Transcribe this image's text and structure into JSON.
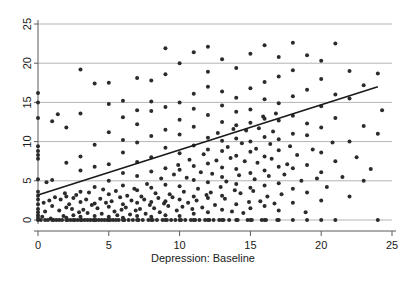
{
  "chart_data": {
    "type": "scatter",
    "title": "",
    "subtitle": "",
    "xlabel": "Depression: Baseline",
    "ylabel": "",
    "xlim": [
      0,
      25
    ],
    "ylim": [
      0,
      25
    ],
    "xticks": [
      0,
      5,
      10,
      15,
      20,
      25
    ],
    "yticks": [
      0,
      5,
      10,
      15,
      20,
      25
    ],
    "xtick_labels": [
      "0",
      "5",
      "10",
      "15",
      "20",
      "25"
    ],
    "ytick_labels": [
      "0",
      "5",
      "10",
      "15",
      "20",
      "25"
    ],
    "grid": "horizontal",
    "grid_color": "#b4b4b4",
    "legend": "none",
    "point_color": "#2b2b2b",
    "point_size": 4,
    "line_color": "#1a1a1a",
    "axis_color": "#5a5a5a",
    "fit_line": {
      "name": "linear fit",
      "x": [
        0,
        24
      ],
      "y": [
        3.2,
        17.0
      ],
      "slope": 0.575,
      "intercept": 3.2
    },
    "points": [
      [
        0.0,
        0.0
      ],
      [
        0.0,
        0.3
      ],
      [
        0.0,
        0.6
      ],
      [
        0.0,
        1.0
      ],
      [
        0.0,
        1.4
      ],
      [
        0.0,
        2.0
      ],
      [
        0.0,
        2.6
      ],
      [
        0.0,
        3.1
      ],
      [
        0.0,
        3.6
      ],
      [
        0.0,
        5.2
      ],
      [
        0.0,
        7.8
      ],
      [
        0.0,
        8.3
      ],
      [
        0.0,
        8.8
      ],
      [
        0.0,
        9.4
      ],
      [
        0.0,
        13.0
      ],
      [
        0.0,
        15.0
      ],
      [
        0.0,
        16.2
      ],
      [
        0.2,
        0.0
      ],
      [
        0.3,
        0.4
      ],
      [
        0.4,
        2.2
      ],
      [
        0.5,
        0.0
      ],
      [
        0.5,
        1.1
      ],
      [
        0.6,
        4.8
      ],
      [
        0.7,
        0.0
      ],
      [
        0.8,
        2.5
      ],
      [
        0.9,
        0.2
      ],
      [
        1.0,
        0.0
      ],
      [
        1.0,
        1.8
      ],
      [
        1.0,
        5.1
      ],
      [
        1.0,
        12.6
      ],
      [
        1.1,
        0.0
      ],
      [
        1.2,
        2.9
      ],
      [
        1.3,
        0.0
      ],
      [
        1.4,
        13.5
      ],
      [
        1.5,
        0.0
      ],
      [
        1.5,
        1.2
      ],
      [
        1.6,
        2.6
      ],
      [
        1.7,
        0.0
      ],
      [
        1.8,
        0.5
      ],
      [
        1.9,
        3.4
      ],
      [
        2.0,
        0.0
      ],
      [
        2.0,
        0.3
      ],
      [
        2.0,
        1.6
      ],
      [
        2.0,
        3.0
      ],
      [
        2.0,
        7.3
      ],
      [
        2.0,
        11.8
      ],
      [
        2.1,
        0.0
      ],
      [
        2.2,
        2.0
      ],
      [
        2.3,
        0.0
      ],
      [
        2.4,
        1.4
      ],
      [
        2.5,
        0.0
      ],
      [
        2.5,
        0.6
      ],
      [
        2.5,
        2.8
      ],
      [
        2.6,
        0.0
      ],
      [
        2.7,
        3.2
      ],
      [
        2.8,
        0.0
      ],
      [
        2.9,
        1.0
      ],
      [
        3.0,
        0.0
      ],
      [
        3.0,
        0.4
      ],
      [
        3.0,
        2.3
      ],
      [
        3.0,
        3.6
      ],
      [
        3.0,
        6.3
      ],
      [
        3.0,
        8.1
      ],
      [
        3.0,
        13.6
      ],
      [
        3.0,
        19.2
      ],
      [
        3.1,
        0.0
      ],
      [
        3.2,
        1.3
      ],
      [
        3.3,
        0.0
      ],
      [
        3.4,
        2.6
      ],
      [
        3.5,
        0.0
      ],
      [
        3.5,
        0.9
      ],
      [
        3.6,
        3.5
      ],
      [
        3.7,
        0.0
      ],
      [
        3.8,
        1.9
      ],
      [
        3.9,
        0.0
      ],
      [
        4.0,
        0.0
      ],
      [
        4.0,
        0.5
      ],
      [
        4.0,
        2.1
      ],
      [
        4.0,
        4.2
      ],
      [
        4.0,
        6.8
      ],
      [
        4.0,
        9.6
      ],
      [
        4.0,
        17.4
      ],
      [
        4.1,
        0.0
      ],
      [
        4.2,
        1.5
      ],
      [
        4.3,
        0.0
      ],
      [
        4.4,
        2.7
      ],
      [
        4.5,
        0.0
      ],
      [
        4.5,
        0.8
      ],
      [
        4.6,
        3.9
      ],
      [
        4.7,
        0.0
      ],
      [
        4.8,
        2.2
      ],
      [
        4.9,
        0.0
      ],
      [
        5.0,
        0.0
      ],
      [
        5.0,
        0.4
      ],
      [
        5.0,
        1.7
      ],
      [
        5.0,
        3.3
      ],
      [
        5.0,
        5.0
      ],
      [
        5.0,
        7.1
      ],
      [
        5.0,
        11.2
      ],
      [
        5.0,
        14.8
      ],
      [
        5.0,
        17.5
      ],
      [
        5.1,
        0.0
      ],
      [
        5.2,
        2.4
      ],
      [
        5.3,
        0.0
      ],
      [
        5.4,
        1.1
      ],
      [
        5.5,
        0.0
      ],
      [
        5.5,
        3.7
      ],
      [
        5.6,
        0.6
      ],
      [
        5.7,
        0.0
      ],
      [
        5.8,
        2.9
      ],
      [
        5.9,
        1.3
      ],
      [
        6.0,
        0.0
      ],
      [
        6.0,
        0.3
      ],
      [
        6.0,
        2.0
      ],
      [
        6.0,
        4.4
      ],
      [
        6.0,
        6.0
      ],
      [
        6.0,
        8.6
      ],
      [
        6.0,
        10.2
      ],
      [
        6.0,
        13.1
      ],
      [
        6.0,
        15.2
      ],
      [
        6.1,
        0.0
      ],
      [
        6.2,
        1.6
      ],
      [
        6.3,
        3.1
      ],
      [
        6.4,
        0.0
      ],
      [
        6.5,
        0.7
      ],
      [
        6.6,
        2.5
      ],
      [
        6.7,
        0.0
      ],
      [
        6.8,
        4.0
      ],
      [
        6.9,
        1.2
      ],
      [
        7.0,
        0.0
      ],
      [
        7.0,
        0.5
      ],
      [
        7.0,
        2.2
      ],
      [
        7.0,
        3.8
      ],
      [
        7.0,
        5.6
      ],
      [
        7.0,
        7.4
      ],
      [
        7.0,
        9.9
      ],
      [
        7.0,
        12.2
      ],
      [
        7.0,
        14.0
      ],
      [
        7.0,
        18.1
      ],
      [
        7.1,
        0.0
      ],
      [
        7.2,
        1.4
      ],
      [
        7.3,
        3.0
      ],
      [
        7.4,
        0.0
      ],
      [
        7.5,
        2.6
      ],
      [
        7.6,
        0.8
      ],
      [
        7.7,
        4.6
      ],
      [
        7.8,
        0.0
      ],
      [
        7.9,
        1.9
      ],
      [
        8.0,
        0.0
      ],
      [
        8.0,
        0.4
      ],
      [
        8.0,
        2.3
      ],
      [
        8.0,
        4.1
      ],
      [
        8.0,
        6.2
      ],
      [
        8.0,
        8.0
      ],
      [
        8.0,
        10.7
      ],
      [
        8.0,
        13.9
      ],
      [
        8.0,
        15.1
      ],
      [
        8.0,
        17.8
      ],
      [
        8.1,
        0.0
      ],
      [
        8.2,
        1.5
      ],
      [
        8.3,
        3.4
      ],
      [
        8.4,
        0.0
      ],
      [
        8.5,
        2.8
      ],
      [
        8.6,
        1.0
      ],
      [
        8.7,
        5.3
      ],
      [
        8.8,
        0.0
      ],
      [
        8.9,
        2.1
      ],
      [
        9.0,
        0.0
      ],
      [
        9.0,
        0.6
      ],
      [
        9.0,
        2.4
      ],
      [
        9.0,
        4.5
      ],
      [
        9.0,
        6.6
      ],
      [
        9.0,
        9.2
      ],
      [
        9.0,
        11.5
      ],
      [
        9.0,
        14.4
      ],
      [
        9.0,
        18.6
      ],
      [
        9.0,
        21.9
      ],
      [
        9.1,
        0.0
      ],
      [
        9.2,
        1.8
      ],
      [
        9.3,
        3.3
      ],
      [
        9.4,
        0.0
      ],
      [
        9.5,
        2.9
      ],
      [
        9.6,
        5.8
      ],
      [
        9.7,
        0.0
      ],
      [
        9.8,
        1.2
      ],
      [
        9.9,
        7.0
      ],
      [
        10.0,
        0.0
      ],
      [
        10.0,
        0.5
      ],
      [
        10.0,
        2.6
      ],
      [
        10.0,
        4.3
      ],
      [
        10.0,
        6.4
      ],
      [
        10.0,
        8.5
      ],
      [
        10.0,
        10.9
      ],
      [
        10.0,
        12.8
      ],
      [
        10.0,
        15.0
      ],
      [
        10.0,
        20.0
      ],
      [
        10.1,
        0.0
      ],
      [
        10.2,
        1.7
      ],
      [
        10.3,
        3.6
      ],
      [
        10.4,
        0.0
      ],
      [
        10.5,
        5.4
      ],
      [
        10.6,
        2.2
      ],
      [
        10.7,
        7.7
      ],
      [
        10.8,
        0.0
      ],
      [
        10.9,
        1.4
      ],
      [
        11.0,
        0.0
      ],
      [
        11.0,
        0.8
      ],
      [
        11.0,
        3.0
      ],
      [
        11.0,
        5.1
      ],
      [
        11.0,
        6.9
      ],
      [
        11.0,
        9.5
      ],
      [
        11.0,
        11.9
      ],
      [
        11.0,
        14.2
      ],
      [
        11.0,
        16.1
      ],
      [
        11.0,
        21.4
      ],
      [
        11.1,
        0.0
      ],
      [
        11.2,
        2.5
      ],
      [
        11.3,
        4.0
      ],
      [
        11.4,
        0.0
      ],
      [
        11.5,
        6.1
      ],
      [
        11.6,
        1.6
      ],
      [
        11.7,
        8.4
      ],
      [
        11.8,
        0.0
      ],
      [
        11.9,
        3.2
      ],
      [
        12.0,
        0.0
      ],
      [
        12.0,
        1.0
      ],
      [
        12.0,
        2.8
      ],
      [
        12.0,
        4.8
      ],
      [
        12.0,
        7.2
      ],
      [
        12.0,
        9.0
      ],
      [
        12.0,
        10.5
      ],
      [
        12.0,
        13.4
      ],
      [
        12.0,
        17.0
      ],
      [
        12.0,
        18.9
      ],
      [
        12.0,
        22.1
      ],
      [
        12.1,
        0.0
      ],
      [
        12.2,
        3.5
      ],
      [
        12.3,
        5.9
      ],
      [
        12.4,
        0.0
      ],
      [
        12.5,
        1.9
      ],
      [
        12.6,
        7.6
      ],
      [
        12.7,
        11.1
      ],
      [
        12.8,
        0.0
      ],
      [
        12.9,
        4.2
      ],
      [
        13.0,
        0.0
      ],
      [
        13.0,
        1.3
      ],
      [
        13.0,
        3.1
      ],
      [
        13.0,
        5.5
      ],
      [
        13.0,
        6.7
      ],
      [
        13.0,
        8.8
      ],
      [
        13.0,
        10.1
      ],
      [
        13.0,
        12.5
      ],
      [
        13.0,
        14.6
      ],
      [
        13.0,
        16.4
      ],
      [
        13.0,
        20.5
      ],
      [
        13.1,
        0.0
      ],
      [
        13.2,
        2.7
      ],
      [
        13.3,
        4.9
      ],
      [
        13.4,
        9.3
      ],
      [
        13.5,
        0.0
      ],
      [
        13.6,
        7.9
      ],
      [
        13.7,
        1.1
      ],
      [
        13.8,
        11.6
      ],
      [
        13.9,
        3.8
      ],
      [
        14.0,
        0.0
      ],
      [
        14.0,
        2.0
      ],
      [
        14.0,
        4.6
      ],
      [
        14.0,
        6.5
      ],
      [
        14.0,
        8.2
      ],
      [
        14.0,
        10.4
      ],
      [
        14.0,
        12.1
      ],
      [
        14.0,
        13.8
      ],
      [
        14.0,
        15.6
      ],
      [
        14.0,
        19.4
      ],
      [
        14.1,
        0.0
      ],
      [
        14.2,
        5.7
      ],
      [
        14.3,
        3.4
      ],
      [
        14.4,
        9.8
      ],
      [
        14.5,
        0.9
      ],
      [
        14.6,
        7.5
      ],
      [
        14.7,
        11.4
      ],
      [
        14.8,
        0.0
      ],
      [
        14.9,
        2.3
      ],
      [
        15.0,
        0.0
      ],
      [
        15.0,
        1.5
      ],
      [
        15.0,
        4.1
      ],
      [
        15.0,
        6.0
      ],
      [
        15.0,
        8.7
      ],
      [
        15.0,
        10.0
      ],
      [
        15.0,
        12.4
      ],
      [
        15.0,
        14.1
      ],
      [
        15.0,
        16.8
      ],
      [
        15.0,
        21.2
      ],
      [
        15.1,
        0.0
      ],
      [
        15.2,
        3.7
      ],
      [
        15.3,
        5.2
      ],
      [
        15.4,
        9.1
      ],
      [
        15.5,
        7.3
      ],
      [
        15.6,
        11.7
      ],
      [
        15.7,
        2.4
      ],
      [
        15.8,
        0.0
      ],
      [
        15.9,
        13.2
      ],
      [
        16.0,
        0.0
      ],
      [
        16.0,
        1.8
      ],
      [
        16.0,
        4.4
      ],
      [
        16.0,
        6.3
      ],
      [
        16.0,
        8.1
      ],
      [
        16.0,
        10.6
      ],
      [
        16.0,
        12.9
      ],
      [
        16.0,
        15.4
      ],
      [
        16.0,
        17.6
      ],
      [
        16.0,
        22.3
      ],
      [
        16.1,
        0.0
      ],
      [
        16.2,
        3.0
      ],
      [
        16.3,
        5.6
      ],
      [
        16.4,
        9.7
      ],
      [
        16.5,
        7.8
      ],
      [
        16.6,
        11.3
      ],
      [
        16.7,
        2.1
      ],
      [
        16.8,
        13.6
      ],
      [
        16.9,
        0.0
      ],
      [
        17.0,
        0.0
      ],
      [
        17.0,
        1.2
      ],
      [
        17.0,
        4.7
      ],
      [
        17.0,
        6.8
      ],
      [
        17.0,
        8.9
      ],
      [
        17.0,
        10.3
      ],
      [
        17.0,
        12.7
      ],
      [
        17.0,
        14.9
      ],
      [
        17.0,
        18.3
      ],
      [
        17.0,
        20.8
      ],
      [
        17.2,
        3.3
      ],
      [
        17.4,
        5.8
      ],
      [
        17.6,
        7.1
      ],
      [
        17.8,
        9.4
      ],
      [
        18.0,
        0.0
      ],
      [
        18.0,
        2.2
      ],
      [
        18.0,
        4.0
      ],
      [
        18.0,
        6.6
      ],
      [
        18.0,
        11.0
      ],
      [
        18.0,
        13.3
      ],
      [
        18.0,
        15.8
      ],
      [
        18.0,
        19.1
      ],
      [
        18.0,
        22.6
      ],
      [
        18.3,
        8.3
      ],
      [
        18.6,
        5.0
      ],
      [
        18.9,
        1.0
      ],
      [
        19.0,
        0.0
      ],
      [
        19.0,
        3.5
      ],
      [
        19.0,
        7.0
      ],
      [
        19.0,
        10.8
      ],
      [
        19.0,
        12.3
      ],
      [
        19.0,
        16.6
      ],
      [
        19.0,
        21.0
      ],
      [
        19.4,
        9.0
      ],
      [
        19.7,
        5.3
      ],
      [
        20.0,
        0.0
      ],
      [
        20.0,
        2.5
      ],
      [
        20.0,
        6.1
      ],
      [
        20.0,
        8.6
      ],
      [
        20.0,
        11.8
      ],
      [
        20.0,
        14.5
      ],
      [
        20.0,
        18.0
      ],
      [
        20.0,
        20.3
      ],
      [
        20.4,
        4.2
      ],
      [
        20.8,
        9.9
      ],
      [
        21.0,
        0.0
      ],
      [
        21.0,
        7.5
      ],
      [
        21.0,
        13.0
      ],
      [
        21.0,
        16.0
      ],
      [
        21.0,
        22.5
      ],
      [
        21.5,
        5.5
      ],
      [
        22.0,
        3.0
      ],
      [
        22.0,
        10.0
      ],
      [
        22.0,
        15.5
      ],
      [
        22.0,
        19.0
      ],
      [
        22.5,
        8.0
      ],
      [
        23.0,
        5.0
      ],
      [
        23.0,
        12.0
      ],
      [
        23.0,
        17.2
      ],
      [
        23.5,
        6.5
      ],
      [
        24.0,
        0.0
      ],
      [
        24.0,
        11.0
      ],
      [
        24.0,
        18.7
      ],
      [
        24.3,
        14.0
      ]
    ]
  }
}
